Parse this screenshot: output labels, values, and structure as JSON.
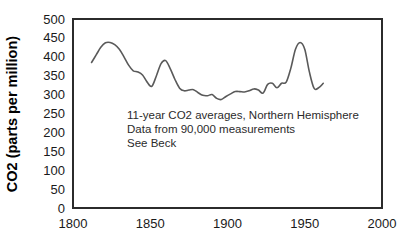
{
  "chart_data": {
    "type": "line",
    "title": "",
    "xlabel": "",
    "ylabel": "CO2 (parts per million)",
    "xlim": [
      1800,
      2000
    ],
    "ylim": [
      0,
      500
    ],
    "xticks": [
      1800,
      1850,
      1900,
      1950,
      2000
    ],
    "yticks": [
      0,
      50,
      100,
      150,
      200,
      250,
      300,
      350,
      400,
      450,
      500
    ],
    "grid": true,
    "legend": "none",
    "series": [
      {
        "name": "11-year CO2 averages, Northern Hemisphere",
        "color": "#5a5a5a",
        "x": [
          1812,
          1815,
          1818,
          1821,
          1824,
          1827,
          1830,
          1833,
          1836,
          1839,
          1842,
          1845,
          1848,
          1851,
          1854,
          1857,
          1860,
          1863,
          1866,
          1869,
          1872,
          1875,
          1878,
          1881,
          1884,
          1887,
          1890,
          1893,
          1896,
          1899,
          1902,
          1905,
          1908,
          1911,
          1914,
          1917,
          1920,
          1923,
          1926,
          1929,
          1932,
          1935,
          1938,
          1941,
          1944,
          1947,
          1950,
          1953,
          1956,
          1959,
          1962
        ],
        "y": [
          385,
          405,
          425,
          437,
          438,
          432,
          420,
          400,
          378,
          363,
          360,
          352,
          333,
          322,
          350,
          382,
          390,
          368,
          340,
          317,
          310,
          312,
          313,
          305,
          298,
          297,
          300,
          290,
          287,
          295,
          302,
          308,
          308,
          307,
          310,
          315,
          312,
          304,
          327,
          330,
          318,
          330,
          333,
          370,
          420,
          438,
          420,
          360,
          317,
          318,
          330
        ]
      }
    ],
    "annotations": [
      "11-year CO2 averages, Northern Hemisphere",
      "Data from 90,000 measurements",
      "See Beck"
    ]
  },
  "colors": {
    "line": "#5a5a5a",
    "frame": "#2b2b2b",
    "grid": "#f0f0f2",
    "text": "#1a1a1a",
    "background": "#ffffff"
  }
}
